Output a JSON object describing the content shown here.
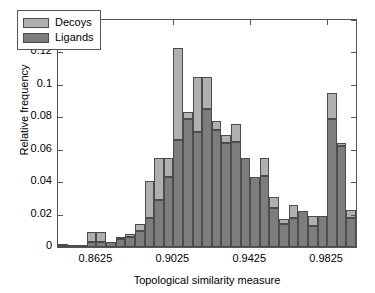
{
  "chart_data": {
    "type": "bar",
    "subtype": "stacked-histogram",
    "title": "",
    "xlabel": "Topological similarity measure",
    "ylabel": "Relative frequency",
    "ylim": [
      0,
      0.14
    ],
    "yticks": [
      0,
      0.02,
      0.04,
      0.06,
      0.08,
      0.1,
      0.12,
      0.14
    ],
    "ytick_labels": [
      "0",
      "0.02",
      "0.04",
      "0.06",
      "0.08",
      "0.1",
      "0.12",
      "0.14"
    ],
    "xlim": [
      0.8425,
      0.9975
    ],
    "xticks": [
      0.8625,
      0.9025,
      0.9425,
      0.9825
    ],
    "xtick_labels": [
      "0.8625",
      "0.9025",
      "0.9425",
      "0.9825"
    ],
    "grid": false,
    "legend_position": "upper left",
    "bin_width": 0.005,
    "bin_centers": [
      0.845,
      0.85,
      0.855,
      0.86,
      0.865,
      0.87,
      0.875,
      0.88,
      0.885,
      0.89,
      0.895,
      0.9,
      0.905,
      0.91,
      0.915,
      0.92,
      0.925,
      0.93,
      0.935,
      0.94,
      0.945,
      0.95,
      0.955,
      0.96,
      0.965,
      0.97,
      0.975,
      0.98,
      0.985,
      0.99,
      0.995
    ],
    "series": [
      {
        "name": "Ligands",
        "color": "#7d7d7d",
        "values": [
          0.0005,
          0.0,
          0.0,
          0.003,
          0.003,
          0.003,
          0.005,
          0.006,
          0.01,
          0.018,
          0.029,
          0.043,
          0.066,
          0.079,
          0.071,
          0.085,
          0.072,
          0.064,
          0.065,
          0.055,
          0.043,
          0.044,
          0.024,
          0.014,
          0.018,
          0.022,
          0.013,
          0.019,
          0.079,
          0.062,
          0.018
        ]
      },
      {
        "name": "Decoys",
        "color": "#b0b0b0",
        "values": [
          0.0005,
          0.0005,
          0.001,
          0.006,
          0.006,
          0.0,
          0.001,
          0.002,
          0.004,
          0.023,
          0.026,
          0.012,
          0.057,
          0.004,
          0.034,
          0.02,
          0.006,
          0.005,
          0.011,
          0.0,
          0.0,
          0.011,
          0.007,
          0.003,
          0.008,
          0.0,
          0.006,
          0.0,
          0.016,
          0.002,
          0.005
        ]
      }
    ],
    "stack_totals": [
      0.001,
      0.0005,
      0.001,
      0.009,
      0.009,
      0.003,
      0.006,
      0.008,
      0.014,
      0.041,
      0.055,
      0.055,
      0.123,
      0.083,
      0.105,
      0.105,
      0.078,
      0.069,
      0.076,
      0.055,
      0.043,
      0.055,
      0.031,
      0.017,
      0.026,
      0.022,
      0.019,
      0.019,
      0.095,
      0.064,
      0.023
    ]
  },
  "legend": {
    "items": [
      {
        "label": "Decoys"
      },
      {
        "label": "Ligands"
      }
    ]
  }
}
